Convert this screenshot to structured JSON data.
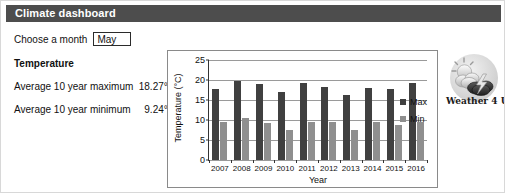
{
  "header": {
    "title": "Climate dashboard",
    "bar_color": "#4d4d4d"
  },
  "controls": {
    "month_label": "Choose a month",
    "month_value": "May"
  },
  "temperature_panel": {
    "section_title": "Temperature",
    "stats": [
      {
        "label": "Average 10 year maximum",
        "value": "18.27°C"
      },
      {
        "label": "Average 10 year minimum",
        "value": "9.24°C"
      }
    ]
  },
  "logo": {
    "caption": "Weather 4 U",
    "icon_name": "sun-cloud-lightning-icon"
  },
  "chart_data": {
    "type": "bar",
    "title": "",
    "xlabel": "Year",
    "ylabel": "Temperature (°C)",
    "ylim": [
      0,
      25
    ],
    "yticks": [
      0,
      5,
      10,
      15,
      20,
      25
    ],
    "grid": true,
    "legend_position": "right",
    "categories": [
      "2007",
      "2008",
      "2009",
      "2010",
      "2011",
      "2012",
      "2013",
      "2014",
      "2015",
      "2016"
    ],
    "series": [
      {
        "name": "Max",
        "color": "#404040",
        "values": [
          17.7,
          19.7,
          18.9,
          17.1,
          19.3,
          18.2,
          16.3,
          17.9,
          17.7,
          19.2
        ]
      },
      {
        "name": "Min",
        "color": "#8f8f8f",
        "values": [
          9.5,
          10.4,
          9.3,
          7.4,
          9.4,
          9.6,
          7.4,
          9.6,
          8.7,
          9.5
        ]
      }
    ]
  }
}
